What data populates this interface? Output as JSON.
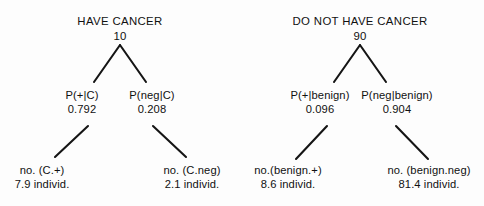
{
  "diagram": {
    "type": "probability-tree",
    "title_visible": false,
    "stroke_color": "#151515",
    "text_color": "#111111",
    "background": "#fdfdfd",
    "trees": [
      {
        "id": "cancer-tree",
        "root": {
          "id": "have-cancer",
          "label": "HAVE CANCER",
          "value": "10",
          "x": 120,
          "y": 14
        },
        "branches": [
          {
            "id": "p-pos-given-cancer",
            "label": "P(+|C)",
            "value": "0.792",
            "x": 82,
            "y": 88
          },
          {
            "id": "p-neg-given-cancer",
            "label": "P(neg|C)",
            "value": "0.208",
            "x": 152,
            "y": 88
          }
        ],
        "leaves": [
          {
            "id": "no-cancer-positive",
            "label": "no. (C.+)",
            "value": "7.9 individ.",
            "x": 42,
            "y": 163
          },
          {
            "id": "no-cancer-negative",
            "label": "no. (C.neg)",
            "value": "2.1 individ.",
            "x": 192,
            "y": 163
          }
        ],
        "edges": [
          {
            "id": "cancer-apex-left",
            "x1": 120,
            "y1": 45,
            "x2": 94,
            "y2": 82
          },
          {
            "id": "cancer-apex-right",
            "x1": 120,
            "y1": 45,
            "x2": 146,
            "y2": 82
          },
          {
            "id": "cancer-pos-leaf",
            "x1": 88,
            "y1": 126,
            "x2": 55,
            "y2": 157
          },
          {
            "id": "cancer-neg-leaf",
            "x1": 153,
            "y1": 126,
            "x2": 186,
            "y2": 157
          }
        ]
      },
      {
        "id": "benign-tree",
        "root": {
          "id": "do-not-have-cancer",
          "label": "DO NOT HAVE CANCER",
          "value": "90",
          "x": 360,
          "y": 14
        },
        "branches": [
          {
            "id": "p-pos-given-benign",
            "label": "P(+|benign)",
            "value": "0.096",
            "x": 320,
            "y": 88
          },
          {
            "id": "p-neg-given-benign",
            "label": "P(neg|benign)",
            "value": "0.904",
            "x": 397,
            "y": 88
          }
        ],
        "leaves": [
          {
            "id": "no-benign-positive",
            "label": "no.(benign.+)",
            "value": "8.6 individ.",
            "x": 288,
            "y": 163
          },
          {
            "id": "no-benign-negative",
            "label": "no. (benign.neg)",
            "value": "81.4 individ.",
            "x": 429,
            "y": 163
          }
        ],
        "edges": [
          {
            "id": "benign-apex-left",
            "x1": 360,
            "y1": 45,
            "x2": 334,
            "y2": 82
          },
          {
            "id": "benign-apex-right",
            "x1": 360,
            "y1": 45,
            "x2": 386,
            "y2": 82
          },
          {
            "id": "benign-pos-leaf",
            "x1": 327,
            "y1": 126,
            "x2": 296,
            "y2": 159
          },
          {
            "id": "benign-neg-leaf",
            "x1": 396,
            "y1": 126,
            "x2": 428,
            "y2": 159
          }
        ]
      }
    ]
  }
}
